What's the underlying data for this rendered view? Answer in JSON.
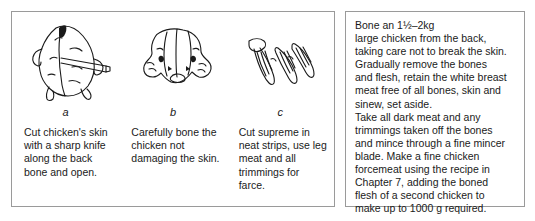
{
  "figure_panel": {
    "steps": [
      {
        "letter": "a",
        "illustration": "chicken-back-with-knife-illustration",
        "caption": "Cut chicken's skin with a sharp knife along the back bone and open."
      },
      {
        "letter": "b",
        "illustration": "boned-chicken-opened-flat-illustration",
        "caption": "Carefully bone the chicken not damaging the skin."
      },
      {
        "letter": "c",
        "illustration": "supreme-cut-into-neat-strips-illustration",
        "caption": "Cut supreme in neat strips, use leg meat and all trimmings for farce."
      }
    ]
  },
  "instructions_panel": {
    "text": "Bone an 1½–2kg\nlarge chicken from the back,\ntaking care not to break the skin.\nGradually remove the bones\nand flesh, retain the white breast\nmeat free of all bones, skin and\nsinew, set aside.\nTake all dark meat and any\ntrimmings taken off the bones\nand mince through a fine mincer\nblade. Make a fine chicken\nforcemeat using the recipe in\nChapter 7, adding the boned\nflesh of a second chicken to\nmake up to 1000 g required."
  },
  "colors": {
    "border": "#9a9a9a",
    "ink": "#1a1a1a",
    "background": "#ffffff"
  }
}
